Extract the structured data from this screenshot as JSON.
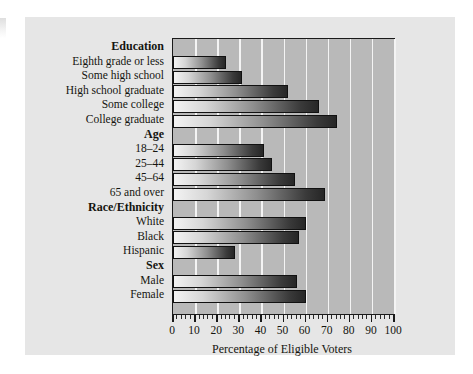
{
  "figure": {
    "panel_background": "#e6e6e6",
    "plot_background": "#b9b9b9",
    "gridline_color": "#f4f4f4",
    "border_color": "#1a1a1a",
    "bar_gradient_from": "#f3f3f3",
    "bar_gradient_to": "#262626"
  },
  "chart_data": {
    "type": "bar",
    "orientation": "horizontal",
    "title": "",
    "xlabel": "Percentage of Eligible Voters",
    "ylabel": "",
    "xlim": [
      0,
      100
    ],
    "xticks": [
      0,
      10,
      20,
      30,
      40,
      50,
      60,
      70,
      80,
      90,
      100
    ],
    "xtick_labels": [
      "0",
      "10",
      "20",
      "30",
      "40",
      "50",
      "60",
      "70",
      "80",
      "90",
      "100"
    ],
    "minor_tick_step": 2,
    "grid": "vertical-major",
    "legend": "none",
    "groups": [
      {
        "name": "Education",
        "categories": [
          "Eighth grade or less",
          "Some high school",
          "High school graduate",
          "Some college",
          "College graduate"
        ],
        "values": [
          24,
          31,
          52,
          66,
          74
        ]
      },
      {
        "name": "Age",
        "categories": [
          "18–24",
          "25–44",
          "45–64",
          "65 and over"
        ],
        "values": [
          41,
          45,
          55,
          69
        ]
      },
      {
        "name": "Race/Ethnicity",
        "categories": [
          "White",
          "Black",
          "Hispanic"
        ],
        "values": [
          60,
          57,
          28
        ]
      },
      {
        "name": "Sex",
        "categories": [
          "Male",
          "Female"
        ],
        "values": [
          56,
          60
        ]
      }
    ]
  }
}
